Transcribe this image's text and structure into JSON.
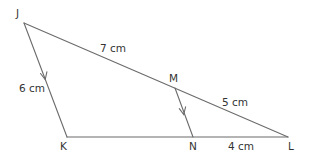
{
  "diagram": {
    "type": "triangle-with-parallel-segment",
    "line_color": "#6b6b6b",
    "text_color": "#333333",
    "points": {
      "J": {
        "label": "J",
        "x": 24,
        "y": 23
      },
      "K": {
        "label": "K",
        "x": 67,
        "y": 137
      },
      "L": {
        "label": "L",
        "x": 288,
        "y": 137
      },
      "M": {
        "label": "M",
        "x": 175,
        "y": 88
      },
      "N": {
        "label": "N",
        "x": 193,
        "y": 137
      }
    },
    "segments": [
      {
        "from": "J",
        "to": "K",
        "parallel_arrow": true
      },
      {
        "from": "K",
        "to": "L",
        "parallel_arrow": false
      },
      {
        "from": "J",
        "to": "L",
        "parallel_arrow": false
      },
      {
        "from": "M",
        "to": "N",
        "parallel_arrow": true
      }
    ],
    "measurements": {
      "JK": "6 cm",
      "JM": "7 cm",
      "ML": "5 cm",
      "NL": "4 cm"
    }
  }
}
